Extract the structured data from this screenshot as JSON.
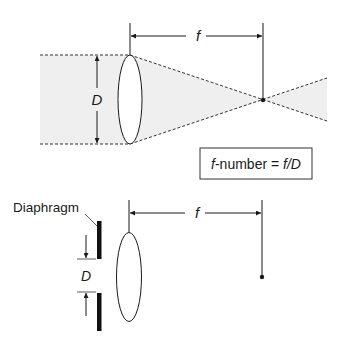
{
  "top_diagram": {
    "focal_length_label": "f",
    "diameter_label": "D",
    "formula_box": {
      "italic_prefix": "f",
      "text_middle": "-number = ",
      "italic_suffix": "f/D"
    }
  },
  "bottom_diagram": {
    "diaphragm_label": "Diaphragm",
    "focal_length_label": "f",
    "aperture_label": "D"
  },
  "colors": {
    "line": "#1a1a1a",
    "light_fill": "#efefef",
    "lens_fill": "#ffffff"
  }
}
